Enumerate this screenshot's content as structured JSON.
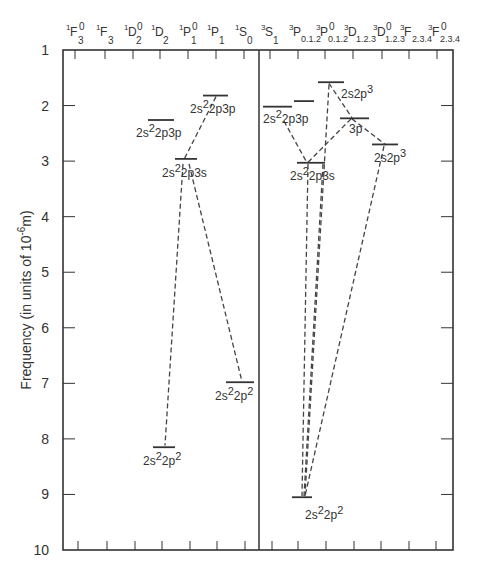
{
  "chart_data": {
    "type": "energy-level-diagram",
    "title": "",
    "ylabel": "Frequency (in units of 10^-6 m)",
    "ylabel_parts": {
      "main": "Frequency (in units of 10",
      "sup": "-6",
      "tail": "m)"
    },
    "ylim": [
      1,
      10
    ],
    "y_inverted": true,
    "y_ticks": [
      1,
      2,
      3,
      4,
      5,
      6,
      7,
      8,
      9,
      10
    ],
    "grid": false,
    "column_labels": [
      {
        "mult": "1",
        "L": "F",
        "J": "3",
        "parity": "0"
      },
      {
        "mult": "1",
        "L": "F",
        "J": "3",
        "parity": ""
      },
      {
        "mult": "1",
        "L": "D",
        "J": "2",
        "parity": "0"
      },
      {
        "mult": "1",
        "L": "D",
        "J": "2",
        "parity": ""
      },
      {
        "mult": "1",
        "L": "P",
        "J": "1",
        "parity": "0"
      },
      {
        "mult": "1",
        "L": "P",
        "J": "1",
        "parity": ""
      },
      {
        "mult": "1",
        "L": "S",
        "J": "0",
        "parity": ""
      },
      {
        "mult": "3",
        "L": "S",
        "J": "1",
        "parity": ""
      },
      {
        "mult": "3",
        "L": "P",
        "J": "0.1.2",
        "parity": ""
      },
      {
        "mult": "3",
        "L": "P",
        "J": "0.1.2",
        "parity": "0"
      },
      {
        "mult": "3",
        "L": "D",
        "J": "1.2.3",
        "parity": ""
      },
      {
        "mult": "3",
        "L": "D",
        "J": "1.2.3",
        "parity": "0"
      },
      {
        "mult": "3",
        "L": "F",
        "J": "2.3.4",
        "parity": ""
      },
      {
        "mult": "3",
        "L": "F",
        "J": "2.3.4",
        "parity": "0"
      }
    ],
    "panels": [
      "singlet",
      "triplet"
    ],
    "levels": [
      {
        "id": "s_3p_a",
        "panel": "singlet",
        "x1": 203,
        "x2": 228,
        "value": 1.82,
        "label": {
          "a": "2s",
          "as": "2",
          "b": "2p3p",
          "bs": ""
        },
        "lx": 190,
        "ly": 113
      },
      {
        "id": "s_3p_b",
        "panel": "singlet",
        "x1": 148,
        "x2": 174,
        "value": 2.26,
        "label": {
          "a": "2s",
          "as": "2",
          "b": "2p3p",
          "bs": ""
        },
        "lx": 136,
        "ly": 137
      },
      {
        "id": "s_3s",
        "panel": "singlet",
        "x1": 175,
        "x2": 197,
        "value": 2.96,
        "label": {
          "a": "2s",
          "as": "2",
          "b": "2p3s",
          "bs": ""
        },
        "lx": 162,
        "ly": 177
      },
      {
        "id": "s_2p2_a",
        "panel": "singlet",
        "x1": 226,
        "x2": 254,
        "value": 6.98,
        "label": {
          "a": "2s",
          "as": "2",
          "b": "2p",
          "bs": "2"
        },
        "lx": 215,
        "ly": 400
      },
      {
        "id": "s_2p2_b",
        "panel": "singlet",
        "x1": 153,
        "x2": 175,
        "value": 8.15,
        "label": {
          "a": "2s",
          "as": "2",
          "b": "2p",
          "bs": "2"
        },
        "lx": 143,
        "ly": 465
      },
      {
        "id": "t_3p_a",
        "panel": "triplet",
        "x1": 263,
        "x2": 292,
        "value": 2.02,
        "label": {
          "a": "2s",
          "as": "2",
          "b": "2p3p",
          "bs": ""
        },
        "lx": 263,
        "ly": 123
      },
      {
        "id": "t_3p_b",
        "panel": "triplet",
        "x1": 294,
        "x2": 314,
        "value": 1.92,
        "label": null
      },
      {
        "id": "t_2p3_a",
        "panel": "triplet",
        "x1": 318,
        "x2": 344,
        "value": 1.58,
        "label": {
          "a": "2s2p",
          "as": "",
          "b": "",
          "bs": "3"
        },
        "lx": 341,
        "ly": 98
      },
      {
        "id": "t_3p_c",
        "panel": "triplet",
        "x1": 340,
        "x2": 369,
        "value": 2.23,
        "label": {
          "a": "3p",
          "as": "",
          "b": "",
          "bs": ""
        },
        "lx": 349,
        "ly": 133
      },
      {
        "id": "t_2p3_b",
        "panel": "triplet",
        "x1": 372,
        "x2": 398,
        "value": 2.7,
        "label": {
          "a": "2s2p",
          "as": "",
          "b": "",
          "bs": "3"
        },
        "lx": 374,
        "ly": 162
      },
      {
        "id": "t_3s",
        "panel": "triplet",
        "x1": 297,
        "x2": 325,
        "value": 3.03,
        "label": {
          "a": "2s",
          "as": "2",
          "b": "2p3s",
          "bs": ""
        },
        "lx": 290,
        "ly": 180
      },
      {
        "id": "t_2p2",
        "panel": "triplet",
        "x1": 292,
        "x2": 312,
        "value": 9.05,
        "label": {
          "a": "2s",
          "as": "2",
          "b": "2p",
          "bs": "2"
        },
        "lx": 305,
        "ly": 519
      }
    ],
    "transitions": [
      {
        "from": "s_3p_a",
        "x1": 216,
        "v1": 1.84,
        "x2": 184,
        "v2": 2.97
      },
      {
        "from": "s_3s",
        "x1": 183,
        "v1": 3.05,
        "x2": 165,
        "v2": 8.12
      },
      {
        "from": "s_3s",
        "x1": 189,
        "v1": 3.05,
        "x2": 242,
        "v2": 6.97
      },
      {
        "from": "t_3p_a",
        "x1": 284,
        "v1": 2.28,
        "x2": 307,
        "v2": 3.03
      },
      {
        "from": "t_3p_c",
        "x1": 351,
        "v1": 2.24,
        "x2": 307,
        "v2": 3.04
      },
      {
        "from": "t_2p3_a",
        "x1": 329,
        "v1": 1.6,
        "x2": 352,
        "v2": 2.22
      },
      {
        "from": "t_3p_c",
        "x1": 352,
        "v1": 2.24,
        "x2": 386,
        "v2": 2.71
      },
      {
        "from": "t_2p3_a",
        "x1": 329,
        "v1": 1.62,
        "x2": 305,
        "v2": 9.03
      },
      {
        "from": "t_3s",
        "x1": 308,
        "v1": 3.05,
        "x2": 302,
        "v2": 9.03
      },
      {
        "from": "t_3s",
        "x1": 323,
        "v1": 3.05,
        "x2": 304,
        "v2": 9.03
      },
      {
        "from": "t_2p3_b",
        "x1": 384,
        "v1": 2.73,
        "x2": 305,
        "v2": 9.03
      }
    ]
  },
  "layout": {
    "plot": {
      "left": 63,
      "right": 453,
      "top": 50,
      "bottom": 550,
      "divider_x": 259
    },
    "top_tick_x": [
      75,
      105,
      133,
      160,
      188,
      216,
      244,
      270,
      298,
      325,
      353,
      382,
      409,
      437
    ],
    "bottom_tick_x": [
      78,
      107,
      135,
      162,
      190,
      217,
      245,
      272,
      298,
      326,
      354,
      381,
      409,
      436
    ],
    "label_x": [
      75,
      105,
      133,
      160,
      188,
      216,
      244,
      270,
      298,
      325,
      353,
      382,
      409,
      437
    ],
    "colors": {
      "ink": "#333333",
      "dash": "#444444",
      "background": "#ffffff"
    }
  }
}
